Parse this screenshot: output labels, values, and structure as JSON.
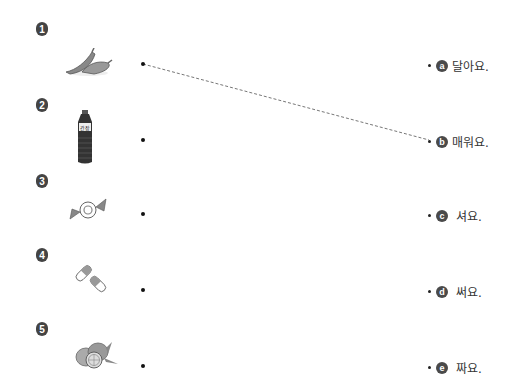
{
  "items": [
    {
      "number": "1",
      "picture": "chili-peppers"
    },
    {
      "number": "2",
      "picture": "soy-sauce-bottle",
      "bottle_label": "간장"
    },
    {
      "number": "3",
      "picture": "wrapped-candy"
    },
    {
      "number": "4",
      "picture": "pills"
    },
    {
      "number": "5",
      "picture": "lemons"
    }
  ],
  "answers": [
    {
      "letter": "a",
      "text": "달아요."
    },
    {
      "letter": "b",
      "text": "매워요."
    },
    {
      "letter": "c",
      "text": "셔요."
    },
    {
      "letter": "d",
      "text": "써요."
    },
    {
      "letter": "e",
      "text": "짜요."
    }
  ],
  "connections": [
    {
      "from_item": "1",
      "to_answer": "b",
      "style": "dashed"
    }
  ],
  "colors": {
    "badge": "#4a4a4a",
    "line": "#777777",
    "dot": "#111111"
  }
}
